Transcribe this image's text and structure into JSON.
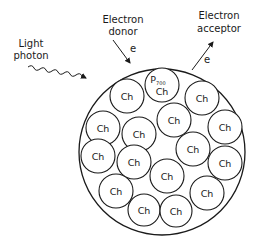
{
  "diagram": {
    "labels": {
      "light_photon_line1": "Light",
      "light_photon_line2": "photon",
      "donor_line1": "Electron",
      "donor_line2": "donor",
      "acceptor_line1": "Electron",
      "acceptor_line2": "acceptor",
      "electron_in": "e",
      "electron_out": "e"
    },
    "reaction_center": {
      "top": "P",
      "subscript": "700",
      "bottom": "Ch"
    },
    "chlorophyll_label": "Ch",
    "chlorophylls": [
      {
        "label": "Ch"
      },
      {
        "label": "Ch"
      },
      {
        "label": "Ch"
      },
      {
        "label": "Ch"
      },
      {
        "label": "Ch"
      },
      {
        "label": "Ch"
      },
      {
        "label": "Ch"
      },
      {
        "label": "Ch"
      },
      {
        "label": "Ch"
      },
      {
        "label": "Ch"
      },
      {
        "label": "Ch"
      },
      {
        "label": "Ch"
      },
      {
        "label": "Ch"
      },
      {
        "label": "Ch"
      },
      {
        "label": "Ch"
      }
    ]
  }
}
